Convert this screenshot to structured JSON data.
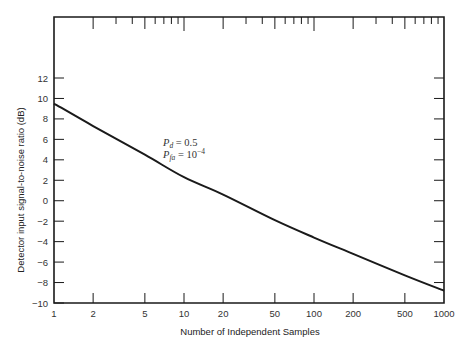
{
  "chart_data": {
    "type": "line",
    "title": "",
    "xlabel": "Number of Independent Samples",
    "ylabel": "Detector input signal-to-noise ratio (dB)",
    "xscale": "log",
    "xlim": [
      1,
      1000
    ],
    "ylim": [
      -10,
      12
    ],
    "x_ticks": [
      1,
      2,
      5,
      10,
      20,
      50,
      100,
      200,
      500,
      1000
    ],
    "x_tick_labels": [
      "1",
      "2",
      "5",
      "10",
      "20",
      "50",
      "100",
      "200",
      "500",
      "1000"
    ],
    "y_ticks": [
      -10,
      -8,
      -6,
      -4,
      -2,
      0,
      2,
      4,
      6,
      8,
      10,
      12
    ],
    "y_tick_labels": [
      "−10",
      "−8",
      "−6",
      "−4",
      "−2",
      "0",
      "2",
      "4",
      "6",
      "8",
      "10",
      "12"
    ],
    "grid": false,
    "annotations": [
      {
        "text_main": "P",
        "text_sub": "d",
        "text_rest": " = 0.5"
      },
      {
        "text_main": "P",
        "text_sub": "fa",
        "text_rest": " = 10",
        "text_sup": "−4"
      }
    ],
    "series": [
      {
        "name": "Pd = 0.5, Pfa = 1e-4",
        "x": [
          1,
          2,
          5,
          10,
          20,
          50,
          100,
          200,
          500,
          1000
        ],
        "y": [
          9.5,
          7.3,
          4.5,
          2.3,
          0.6,
          -1.9,
          -3.6,
          -5.2,
          -7.3,
          -8.8
        ]
      }
    ]
  },
  "colors": {
    "line": "#1a1a1a",
    "axis": "#1a1a1a",
    "text": "#333333"
  }
}
